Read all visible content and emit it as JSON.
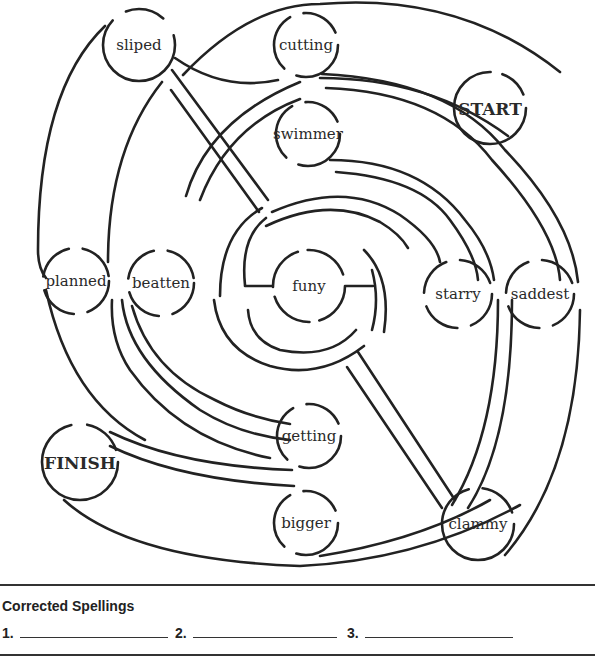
{
  "maze": {
    "start_label": "START",
    "finish_label": "FINISH",
    "center_word": "funy",
    "words": {
      "sliped": "sliped",
      "cutting": "cutting",
      "swimmer": "swimmer",
      "planned": "planned",
      "beatten": "beatten",
      "starry": "starry",
      "saddest": "saddest",
      "getting": "getting",
      "bigger": "bigger",
      "clammy": "clammy"
    },
    "nodes": [
      {
        "id": "start",
        "label": "START",
        "x": 490,
        "y": 108
      },
      {
        "id": "cutting",
        "label": "cutting",
        "x": 306,
        "y": 45
      },
      {
        "id": "swimmer",
        "label": "swimmer",
        "x": 308,
        "y": 134
      },
      {
        "id": "sliped",
        "label": "sliped",
        "x": 139,
        "y": 45
      },
      {
        "id": "planned",
        "label": "planned",
        "x": 76,
        "y": 281
      },
      {
        "id": "beatten",
        "label": "beatten",
        "x": 161,
        "y": 283
      },
      {
        "id": "funy",
        "label": "funy",
        "x": 309,
        "y": 286
      },
      {
        "id": "starry",
        "label": "starry",
        "x": 458,
        "y": 294
      },
      {
        "id": "saddest",
        "label": "saddest",
        "x": 540,
        "y": 294
      },
      {
        "id": "getting",
        "label": "getting",
        "x": 309,
        "y": 436
      },
      {
        "id": "bigger",
        "label": "bigger",
        "x": 306,
        "y": 523
      },
      {
        "id": "clammy",
        "label": "clammy",
        "x": 478,
        "y": 524
      },
      {
        "id": "finish",
        "label": "FINISH",
        "x": 80,
        "y": 462
      }
    ]
  },
  "footer": {
    "title": "Corrected Spellings",
    "blanks": [
      {
        "number": "1.",
        "value": ""
      },
      {
        "number": "2.",
        "value": ""
      },
      {
        "number": "3.",
        "value": ""
      }
    ]
  }
}
